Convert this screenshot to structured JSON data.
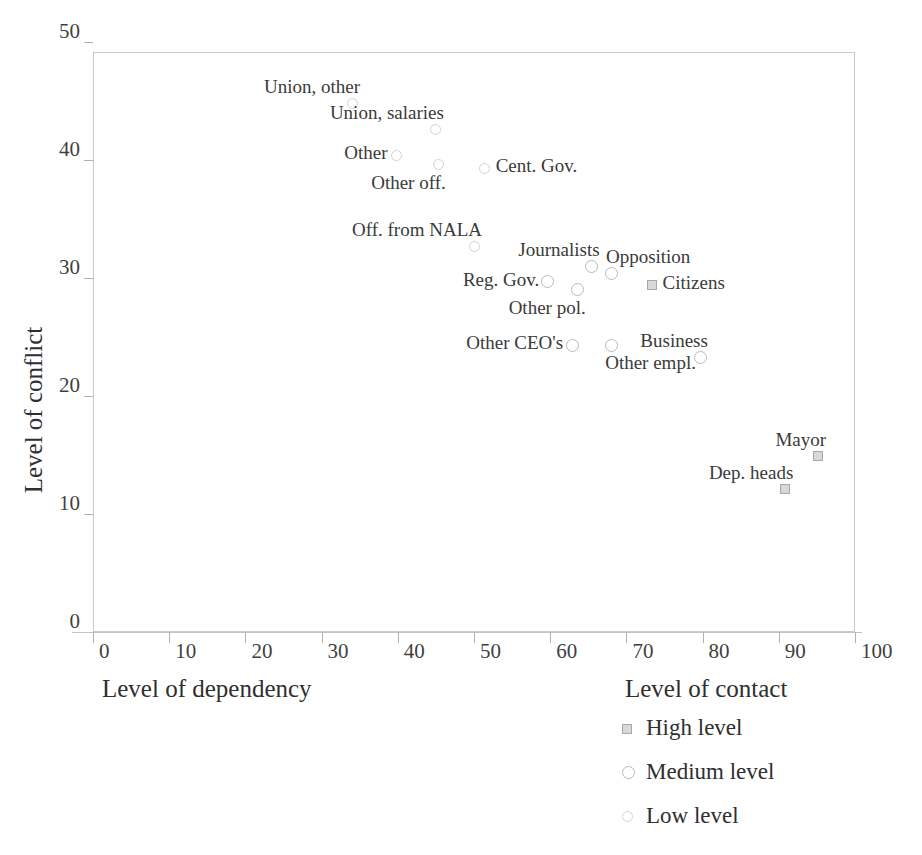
{
  "chart_data": {
    "type": "scatter",
    "title": "",
    "xlabel": "Level of dependency",
    "xlabel_secondary": "Level of contact",
    "ylabel": "Level of conflict",
    "xlim": [
      0,
      100
    ],
    "ylim": [
      0,
      50
    ],
    "xticks": [
      0,
      10,
      20,
      30,
      40,
      50,
      60,
      70,
      80,
      90,
      100
    ],
    "yticks": [
      0,
      10,
      20,
      30,
      40,
      50
    ],
    "grid": false,
    "legend_position": "bottom-right",
    "legend": [
      {
        "key": "high",
        "label": "High level",
        "marker": "square"
      },
      {
        "key": "medium",
        "label": "Medium level",
        "marker": "circle"
      },
      {
        "key": "low",
        "label": "Low level",
        "marker": "circle-light"
      }
    ],
    "points": [
      {
        "label": "Union, other",
        "x": 34,
        "y": 44.8,
        "group": "low",
        "label_pos": "above-left"
      },
      {
        "label": "Union, salaries",
        "x": 45,
        "y": 42.6,
        "group": "low",
        "label_pos": "above-left"
      },
      {
        "label": "Other",
        "x": 39.8,
        "y": 40.4,
        "group": "low",
        "label_pos": "left"
      },
      {
        "label": "Other off.",
        "x": 45.3,
        "y": 39.6,
        "group": "low",
        "label_pos": "below-left"
      },
      {
        "label": "Cent. Gov.",
        "x": 51.4,
        "y": 39.3,
        "group": "low",
        "label_pos": "right"
      },
      {
        "label": "Off. from NALA",
        "x": 50,
        "y": 32.7,
        "group": "low",
        "label_pos": "above-left"
      },
      {
        "label": "Journalists",
        "x": 65.4,
        "y": 31.0,
        "group": "medium",
        "label_pos": "above-left"
      },
      {
        "label": "Opposition",
        "x": 68.1,
        "y": 30.4,
        "group": "medium",
        "label_pos": "above-right"
      },
      {
        "label": "Reg. Gov.",
        "x": 59.7,
        "y": 29.7,
        "group": "medium",
        "label_pos": "left"
      },
      {
        "label": "Citizens",
        "x": 73.3,
        "y": 29.4,
        "group": "high",
        "label_pos": "right"
      },
      {
        "label": "Other pol.",
        "x": 63.6,
        "y": 29.0,
        "group": "medium",
        "label_pos": "below-left"
      },
      {
        "label": "Other CEO's",
        "x": 62.9,
        "y": 24.3,
        "group": "medium",
        "label_pos": "left"
      },
      {
        "label": "Other empl.",
        "x": 68.0,
        "y": 24.3,
        "group": "medium",
        "label_pos": "below-right"
      },
      {
        "label": "Business",
        "x": 79.7,
        "y": 23.3,
        "group": "medium",
        "label_pos": "above-left"
      },
      {
        "label": "Mayor",
        "x": 95.2,
        "y": 14.9,
        "group": "high",
        "label_pos": "above-left"
      },
      {
        "label": "Dep. heads",
        "x": 90.8,
        "y": 12.1,
        "group": "high",
        "label_pos": "above-left"
      }
    ]
  }
}
